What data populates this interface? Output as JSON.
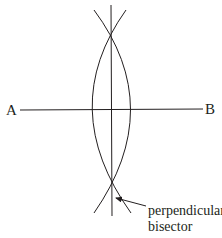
{
  "diagram": {
    "points": {
      "left": "A",
      "right": "B"
    },
    "annotation": {
      "line1": "perpendicular",
      "line2": "bisector"
    },
    "colors": {
      "stroke": "#231f20",
      "background": "#ffffff"
    }
  }
}
